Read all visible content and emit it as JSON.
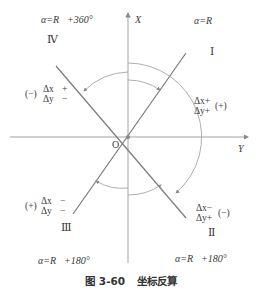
{
  "axes": {
    "x_label": "X",
    "y_label": "Y",
    "origin_label": "O"
  },
  "quadrants": [
    {
      "id": "I",
      "numeral": "Ⅰ",
      "formula": "α=R⃗",
      "dx": "Δx+",
      "dy": "Δy+",
      "sign": "(+)"
    },
    {
      "id": "II",
      "numeral": "Ⅱ",
      "formula": "α=R⃗+180°",
      "dx": "Δx−",
      "dy": "Δy+",
      "sign": "(−)"
    },
    {
      "id": "III",
      "numeral": "Ⅲ",
      "formula": "α=R⃗+180°",
      "dx": "Δx",
      "dy": "Δy",
      "dx_sign": "−",
      "dy_sign": "−",
      "sign": "(+)"
    },
    {
      "id": "IV",
      "numeral": "Ⅳ",
      "formula": "α=R⃗+360°",
      "dx": "Δx",
      "dy": "Δy",
      "dx_sign": "+",
      "dy_sign": "−",
      "sign": "(−)"
    }
  ],
  "caption": {
    "number": "图 3-60",
    "title": "坐标反算"
  },
  "colors": {
    "line": "#8a8a8a",
    "text": "#333333"
  }
}
